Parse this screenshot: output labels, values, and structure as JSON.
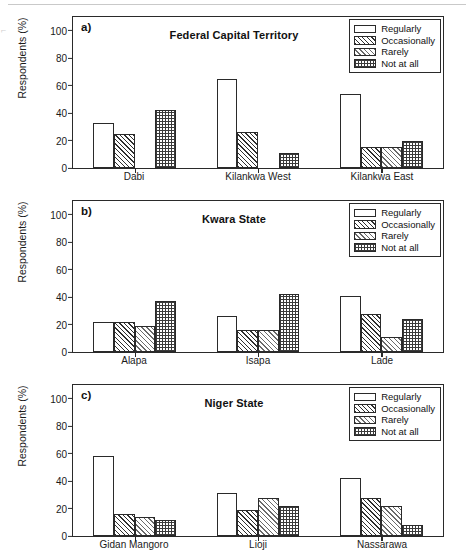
{
  "figure": {
    "y_axis_label": "Respondents (%)",
    "y_ticks": [
      0,
      20,
      40,
      60,
      80,
      100
    ],
    "artifact_mark": "⌐"
  },
  "legend": {
    "entries": [
      {
        "label": "Regularly",
        "pattern": "regularly"
      },
      {
        "label": "Occasionally",
        "pattern": "occasionally"
      },
      {
        "label": "Rarely",
        "pattern": "rarely"
      },
      {
        "label": "Not at all",
        "pattern": "notatall"
      }
    ]
  },
  "chart_data": [
    {
      "type": "bar",
      "panel": "a)",
      "title": "Federal Capital Territory",
      "categories": [
        "Dabi",
        "Kilankwa West",
        "Kilankwa East"
      ],
      "series": [
        {
          "name": "Regularly",
          "values": [
            33,
            65,
            54
          ]
        },
        {
          "name": "Occasionally",
          "values": [
            25,
            26,
            15
          ]
        },
        {
          "name": "Rarely",
          "values": [
            0,
            0,
            15
          ]
        },
        {
          "name": "Not at all",
          "values": [
            42,
            11,
            20
          ]
        }
      ],
      "xlabel": "",
      "ylabel": "Respondents (%)",
      "ylim": [
        0,
        110
      ],
      "yticks": [
        0,
        20,
        40,
        60,
        80,
        100
      ],
      "grid": false,
      "legend_position": "top-right"
    },
    {
      "type": "bar",
      "panel": "b)",
      "title": "Kwara State",
      "categories": [
        "Alapa",
        "Isapa",
        "Lade"
      ],
      "series": [
        {
          "name": "Regularly",
          "values": [
            22,
            26,
            41
          ]
        },
        {
          "name": "Occasionally",
          "values": [
            22,
            16,
            28
          ]
        },
        {
          "name": "Rarely",
          "values": [
            19,
            16,
            11
          ]
        },
        {
          "name": "Not at all",
          "values": [
            37,
            42,
            24
          ]
        }
      ],
      "xlabel": "",
      "ylabel": "Respondents (%)",
      "ylim": [
        0,
        110
      ],
      "yticks": [
        0,
        20,
        40,
        60,
        80,
        100
      ],
      "grid": false,
      "legend_position": "top-right"
    },
    {
      "type": "bar",
      "panel": "c)",
      "title": "Niger State",
      "categories": [
        "Gidan Mangoro",
        "Lioji",
        "Nassarawa"
      ],
      "series": [
        {
          "name": "Regularly",
          "values": [
            58,
            31,
            42
          ]
        },
        {
          "name": "Occasionally",
          "values": [
            16,
            19,
            28
          ]
        },
        {
          "name": "Rarely",
          "values": [
            14,
            28,
            22
          ]
        },
        {
          "name": "Not at all",
          "values": [
            12,
            22,
            8
          ]
        }
      ],
      "xlabel": "",
      "ylabel": "Respondents (%)",
      "ylim": [
        0,
        110
      ],
      "yticks": [
        0,
        20,
        40,
        60,
        80,
        100
      ],
      "grid": false,
      "legend_position": "top-right"
    }
  ]
}
